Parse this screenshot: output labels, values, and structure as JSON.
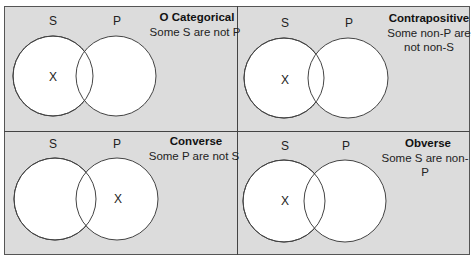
{
  "diagram": {
    "panels": [
      {
        "title": "O Categorical",
        "statement": "Some S are not P",
        "circle_labels": [
          "S",
          "P"
        ],
        "x_mark": "X",
        "x_region": "S only"
      },
      {
        "title": "Contrapositive",
        "statement_lines": [
          "Some non-P are",
          "not non-S"
        ],
        "circle_labels": [
          "S",
          "P"
        ],
        "x_mark": "X",
        "x_region": "S only"
      },
      {
        "title": "Converse",
        "statement": "Some P are not S",
        "circle_labels": [
          "S",
          "P"
        ],
        "x_mark": "X",
        "x_region": "P only"
      },
      {
        "title": "Obverse",
        "statement": "Some S are non-P",
        "circle_labels": [
          "S",
          "P"
        ],
        "x_mark": "X",
        "x_region": "S only"
      }
    ],
    "colors": {
      "background": "#dcdcdc",
      "circle_fill": "#ffffff",
      "stroke": "#444444"
    }
  }
}
